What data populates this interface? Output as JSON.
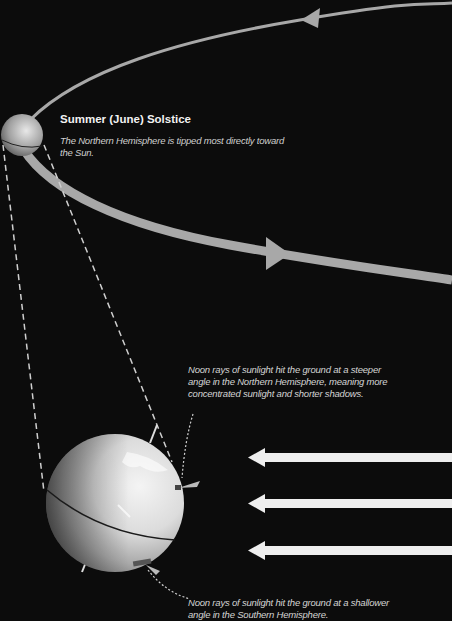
{
  "diagram": {
    "title": "Summer (June) Solstice",
    "subtitle": "The Northern Hemisphere is tipped most directly toward the Sun.",
    "note_northern": "Noon rays of sunlight hit the ground at a steeper angle in the Northern Hemisphere, meaning more concentrated sunlight and shorter shadows.",
    "note_southern": "Noon rays of sunlight hit the ground at a shallower angle in the Southern Hemisphere.",
    "elements": {
      "orbit": "orbit-path",
      "small_earth": "earth-small-icon",
      "large_earth": "earth-large-icon",
      "sun_rays": [
        "sunlight-arrow",
        "sunlight-arrow",
        "sunlight-arrow"
      ]
    },
    "colors": {
      "background": "#0c0c0c",
      "orbit": "#a8a8a8",
      "rays": "#efefef",
      "text": "#f2f2f2"
    }
  }
}
